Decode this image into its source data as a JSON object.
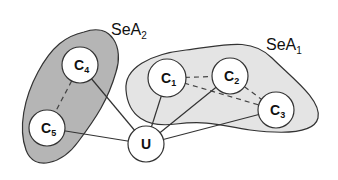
{
  "diagram": {
    "areas": [
      {
        "id": "SeA2",
        "base": "SeA",
        "sub": "2",
        "fill": "#b3b3b3"
      },
      {
        "id": "SeA1",
        "base": "SeA",
        "sub": "1",
        "fill": "#e6e6e6"
      }
    ],
    "nodes": [
      {
        "id": "C1",
        "base": "C",
        "sub": "1",
        "area": "SeA1"
      },
      {
        "id": "C2",
        "base": "C",
        "sub": "2",
        "area": "SeA1"
      },
      {
        "id": "C3",
        "base": "C",
        "sub": "3",
        "area": "SeA1"
      },
      {
        "id": "C4",
        "base": "C",
        "sub": "4",
        "area": "SeA2"
      },
      {
        "id": "C5",
        "base": "C",
        "sub": "5",
        "area": "SeA2"
      },
      {
        "id": "U",
        "base": "U",
        "sub": "",
        "area": null
      }
    ],
    "edges": [
      {
        "from": "U",
        "to": "C1",
        "style": "solid"
      },
      {
        "from": "U",
        "to": "C2",
        "style": "solid"
      },
      {
        "from": "U",
        "to": "C3",
        "style": "solid"
      },
      {
        "from": "U",
        "to": "C4",
        "style": "solid"
      },
      {
        "from": "U",
        "to": "C5",
        "style": "solid"
      },
      {
        "from": "C1",
        "to": "C2",
        "style": "dashed"
      },
      {
        "from": "C1",
        "to": "C3",
        "style": "dashed"
      },
      {
        "from": "C2",
        "to": "C3",
        "style": "dashed"
      },
      {
        "from": "C4",
        "to": "C5",
        "style": "dashed"
      }
    ]
  }
}
